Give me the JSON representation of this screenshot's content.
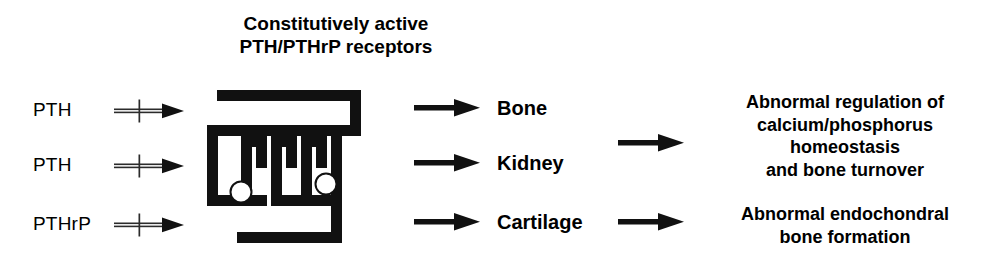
{
  "figure": {
    "kind": "signaling-pathway-diagram",
    "background_color": "#ffffff",
    "ink_color": "#000000"
  },
  "heading": {
    "line1": "Constitutively active",
    "line2": "PTH/PTHrP receptors"
  },
  "ligands": [
    {
      "label": "PTH",
      "arrow": "blocked-arrow-icon"
    },
    {
      "label": "PTH",
      "arrow": "blocked-arrow-icon"
    },
    {
      "label": "PTHrP",
      "arrow": "blocked-arrow-icon"
    }
  ],
  "receptor": {
    "name": "seven-transmembrane-receptor-glyph",
    "ligand_binding_sites": 2
  },
  "targets": [
    {
      "label": "Bone",
      "arrow": "arrow-right-icon"
    },
    {
      "label": "Kidney",
      "arrow": "arrow-right-icon"
    },
    {
      "label": "Cartilage",
      "arrow": "arrow-right-icon"
    }
  ],
  "outcomes": [
    {
      "arrow": "arrow-right-icon",
      "lines": [
        "Abnormal regulation of",
        "calcium/phosphorus",
        "homeostasis",
        "and bone turnover"
      ]
    },
    {
      "arrow": "arrow-right-icon",
      "lines": [
        "Abnormal endochondral",
        "bone formation"
      ]
    }
  ]
}
